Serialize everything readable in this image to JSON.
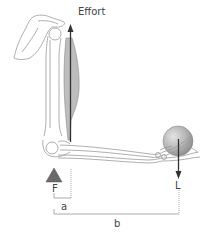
{
  "diagram": {
    "labels": {
      "effort": "Effort",
      "fulcrum": "F",
      "load": "L",
      "effort_arm": "a",
      "load_arm": "b"
    },
    "colors": {
      "outline": "#999999",
      "muscle": "#bdbdbd",
      "arrow": "#333333",
      "fulcrum": "#6a6a6a",
      "ball": "#aaaaaa",
      "dimension": "#888888",
      "text": "#444444"
    }
  }
}
